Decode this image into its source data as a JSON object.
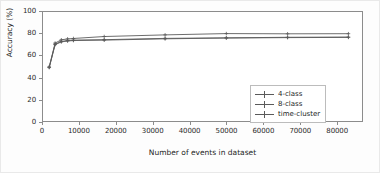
{
  "chart_data": {
    "type": "line",
    "title": "",
    "xlabel": "Number of events in dataset",
    "ylabel": "Accuracy (%)",
    "xlim": [
      0,
      87000
    ],
    "ylim": [
      0,
      100
    ],
    "xticks": [
      0,
      10000,
      20000,
      30000,
      40000,
      50000,
      60000,
      70000,
      80000
    ],
    "xtick_labels": [
      "0",
      "10000",
      "20000",
      "30000",
      "40000",
      "50000",
      "60000",
      "70000",
      "80000"
    ],
    "yticks": [
      0,
      20,
      40,
      60,
      80,
      100
    ],
    "ytick_labels": [
      "0",
      "20",
      "40",
      "60",
      "80",
      "100"
    ],
    "grid": false,
    "legend_position": "lower right",
    "marker": "plus",
    "line_color": "#5a5a5a",
    "x": [
      1700,
      3300,
      5000,
      6700,
      8300,
      16700,
      33300,
      50000,
      66700,
      83300
    ],
    "series": [
      {
        "name": "4-class",
        "values": [
          49.5,
          70.5,
          73.0,
          73.8,
          74.2,
          74.6,
          75.8,
          76.3,
          76.8,
          77.0
        ]
      },
      {
        "name": "8-class",
        "values": [
          49.0,
          70.0,
          72.6,
          73.4,
          73.8,
          74.2,
          75.4,
          76.1,
          76.5,
          76.7
        ]
      },
      {
        "name": "time-cluster",
        "values": [
          49.5,
          71.5,
          74.5,
          75.3,
          75.7,
          77.5,
          79.0,
          80.2,
          80.0,
          80.1
        ]
      }
    ]
  },
  "legend": {
    "items": [
      {
        "label": "4-class"
      },
      {
        "label": "8-class"
      },
      {
        "label": "time-cluster"
      }
    ]
  }
}
